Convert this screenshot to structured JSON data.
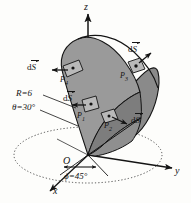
{
  "figure": {
    "axes": {
      "z_label": "z",
      "y_label": "y",
      "x_label": "x",
      "origin_label": "O"
    },
    "parameters": {
      "radius": "R=6",
      "polar_angle": "θ=30°",
      "azimuth_angle": "ϕ=45°"
    },
    "surface_elements": [
      {
        "id": "ds-left",
        "label_prefix": "d",
        "label_vector": "S",
        "point": "P",
        "point_index": "4"
      },
      {
        "id": "ds-top-right",
        "label_prefix": "d",
        "label_vector": "S",
        "point": "P",
        "point_index": "3"
      },
      {
        "id": "ds-center",
        "label_prefix": "d",
        "label_vector": "S",
        "point": "P",
        "point_index": "1"
      },
      {
        "id": "ds-bottom-right",
        "label_prefix": "d",
        "label_vector": "S",
        "point": "P",
        "point_index": "2"
      }
    ],
    "colors": {
      "solid_fill": "#8c8c8c",
      "solid_fill_light": "#a0a0a0",
      "solid_fill_dark": "#787878",
      "stroke": "#141414",
      "background": "#fdfdfb"
    }
  }
}
